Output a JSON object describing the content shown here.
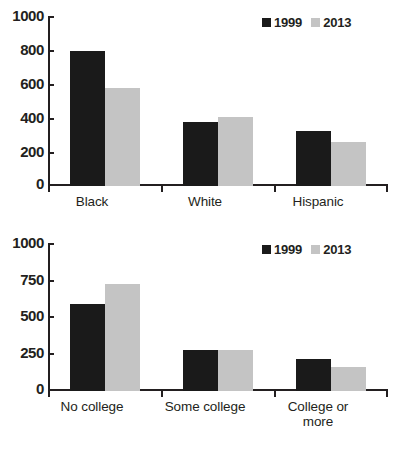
{
  "chart_data": [
    {
      "type": "bar",
      "title": "",
      "xlabel": "",
      "ylabel": "",
      "ylim": [
        0,
        1000
      ],
      "yticks": [
        "0",
        "200",
        "400",
        "600",
        "800",
        "1000"
      ],
      "grid": false,
      "legend_position": "top-right",
      "categories": [
        "Black",
        "White",
        "Hispanic"
      ],
      "series": [
        {
          "name": "1999",
          "color": "#1a1a1a",
          "values": [
            795,
            375,
            325
          ]
        },
        {
          "name": "2013",
          "color": "#c4c4c4",
          "values": [
            575,
            408,
            258
          ]
        }
      ]
    },
    {
      "type": "bar",
      "title": "",
      "xlabel": "",
      "ylabel": "",
      "ylim": [
        0,
        1000
      ],
      "yticks": [
        "0",
        "250",
        "500",
        "750",
        "1000"
      ],
      "grid": false,
      "legend_position": "top-right",
      "categories": [
        "No college",
        "Some college",
        "College or\nmore"
      ],
      "series": [
        {
          "name": "1999",
          "color": "#1a1a1a",
          "values": [
            598,
            283,
            222
          ]
        },
        {
          "name": "2013",
          "color": "#c4c4c4",
          "values": [
            733,
            278,
            163
          ]
        }
      ]
    }
  ]
}
